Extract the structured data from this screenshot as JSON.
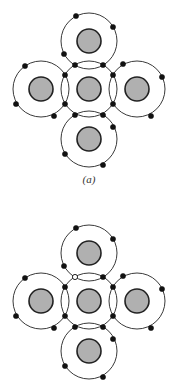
{
  "diagrams": [
    {
      "label": "(a)",
      "offset_y": 0,
      "atoms": [
        {
          "name": "top",
          "cx": 89,
          "cy": 41
        },
        {
          "name": "left",
          "cx": 41,
          "cy": 89
        },
        {
          "name": "center",
          "cx": 89,
          "cy": 89
        },
        {
          "name": "right",
          "cx": 137,
          "cy": 89
        },
        {
          "name": "bottom",
          "cx": 89,
          "cy": 139
        }
      ],
      "electrons": [
        [
          76,
          16,
          "filled"
        ],
        [
          113,
          27,
          "filled"
        ],
        [
          64,
          54,
          "filled"
        ],
        [
          75,
          65,
          "filled"
        ],
        [
          103,
          65,
          "filled"
        ],
        [
          25,
          66,
          "filled"
        ],
        [
          16,
          104,
          "filled"
        ],
        [
          54,
          116,
          "filled"
        ],
        [
          65,
          75,
          "filled"
        ],
        [
          65,
          104,
          "filled"
        ],
        [
          123,
          64,
          "filled"
        ],
        [
          162,
          77,
          "filled"
        ],
        [
          151,
          116,
          "filled"
        ],
        [
          113,
          75,
          "filled"
        ],
        [
          113,
          104,
          "filled"
        ],
        [
          113,
          127,
          "filled"
        ],
        [
          65,
          154,
          "filled"
        ],
        [
          103,
          165,
          "filled"
        ],
        [
          75,
          115,
          "filled"
        ],
        [
          103,
          115,
          "filled"
        ]
      ]
    },
    {
      "label": "",
      "offset_y": 212,
      "atoms": [
        {
          "name": "top",
          "cx": 89,
          "cy": 41
        },
        {
          "name": "left",
          "cx": 41,
          "cy": 89
        },
        {
          "name": "center",
          "cx": 89,
          "cy": 89
        },
        {
          "name": "right",
          "cx": 137,
          "cy": 89
        },
        {
          "name": "bottom",
          "cx": 89,
          "cy": 139
        }
      ],
      "electrons": [
        [
          76,
          16,
          "filled"
        ],
        [
          113,
          27,
          "filled"
        ],
        [
          64,
          54,
          "filled"
        ],
        [
          75,
          65,
          "hollow"
        ],
        [
          103,
          65,
          "filled"
        ],
        [
          25,
          66,
          "filled"
        ],
        [
          16,
          104,
          "filled"
        ],
        [
          54,
          116,
          "filled"
        ],
        [
          65,
          75,
          "filled"
        ],
        [
          65,
          104,
          "filled"
        ],
        [
          123,
          64,
          "filled"
        ],
        [
          162,
          77,
          "filled"
        ],
        [
          151,
          116,
          "filled"
        ],
        [
          113,
          75,
          "filled"
        ],
        [
          113,
          104,
          "filled"
        ],
        [
          113,
          127,
          "filled"
        ],
        [
          65,
          154,
          "filled"
        ],
        [
          103,
          165,
          "filled"
        ],
        [
          75,
          115,
          "filled"
        ],
        [
          103,
          115,
          "filled"
        ]
      ]
    }
  ],
  "style": {
    "orbit_radius": 28,
    "nucleus_radius": 12,
    "nucleus_fill": "#b0b0b0",
    "stroke": "#222222",
    "electron_radius": 2.6
  }
}
